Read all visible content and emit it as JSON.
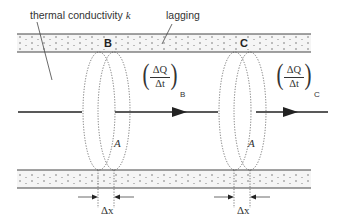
{
  "diagram": {
    "type": "heat conduction through lagged bar",
    "labels": {
      "conductivity": "thermal conductivity k",
      "conductivity_prefix": "thermal conductivity ",
      "conductivity_symbol": "k",
      "lagging": "lagging",
      "section_b": "B",
      "section_c": "C",
      "area_b": "A",
      "area_c": "A",
      "dx_b": "Δx",
      "dx_c": "Δx"
    },
    "flow_b": {
      "numerator": "ΔQ",
      "denominator": "Δt",
      "subscript": "B"
    },
    "flow_c": {
      "numerator": "ΔQ",
      "denominator": "Δt",
      "subscript": "C"
    },
    "colors": {
      "line": "#333333",
      "band_fill": "#f4f4f4",
      "dot": "#555555",
      "arrow": "#222222"
    }
  }
}
